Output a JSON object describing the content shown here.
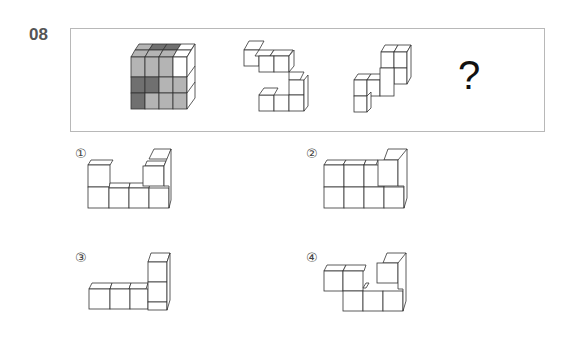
{
  "question": {
    "number": "08",
    "prompt_symbol": "?"
  },
  "sequence": [
    {
      "name": "figure-1",
      "description": "4x3x? block with gray and dark gray shaded cubes"
    },
    {
      "name": "figure-2",
      "description": "white cube piece, S-shaped"
    },
    {
      "name": "figure-3",
      "description": "white cube piece, stepped"
    }
  ],
  "options": [
    {
      "label": "①",
      "value": "1"
    },
    {
      "label": "②",
      "value": "2"
    },
    {
      "label": "③",
      "value": "3"
    },
    {
      "label": "④",
      "value": "4"
    }
  ],
  "colors": {
    "frame_border": "#b8b8b8",
    "cube_white": "#ffffff",
    "cube_gray": "#b4b4b4",
    "cube_dark": "#707070",
    "stroke": "#333333"
  }
}
